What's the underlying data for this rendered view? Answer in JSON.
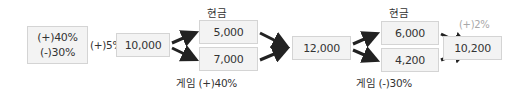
{
  "diagram": {
    "start_box": {
      "line1": "(+)40%",
      "line2": "(-)30%"
    },
    "start_rate": "(+)5%",
    "stage1": {
      "value": "10,000",
      "top_label": "현금",
      "top_value": "5,000",
      "bottom_value": "7,000",
      "bottom_label": "게임 (+)40%"
    },
    "stage2": {
      "value": "12,000",
      "top_label": "현금",
      "top_value": "6,000",
      "bottom_value": "4,200",
      "bottom_label": "게임 (-)30%"
    },
    "final": {
      "rate": "(+)2%",
      "value": "10,200"
    },
    "colors": {
      "box_fill": "#f3f3f3",
      "box_border": "#d4d4d4",
      "arrow": "#222222",
      "faint_text": "#a8a8a8"
    }
  }
}
